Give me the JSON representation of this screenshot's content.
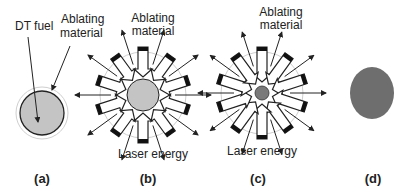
{
  "figure": {
    "colors": {
      "fuel_fill": "#c4c4c4",
      "fuel_small_fill": "#7a7a7a",
      "fuel_ignited_fill": "#6e6e6e",
      "stroke": "#222222",
      "ablator_ring": "#cfcfcf"
    },
    "panels": [
      {
        "id": "a",
        "label": "(a)",
        "annotations": [
          "DT fuel",
          "Ablating material"
        ],
        "annotation_lines": {
          "dt_fuel": "DT fuel",
          "ablating_1": "Ablating",
          "ablating_2": "material"
        }
      },
      {
        "id": "b",
        "label": "(b)",
        "annotation_lines": {
          "ablating_1": "Ablating",
          "ablating_2": "material",
          "laser": "Laser energy"
        },
        "arrows_in": 10,
        "arrows_out": 10
      },
      {
        "id": "c",
        "label": "(c)",
        "annotation_lines": {
          "ablating_1": "Ablating",
          "ablating_2": "material",
          "laser": "Laser energy"
        },
        "arrows_in": 10,
        "arrows_out": 10
      },
      {
        "id": "d",
        "label": "(d)"
      }
    ]
  }
}
